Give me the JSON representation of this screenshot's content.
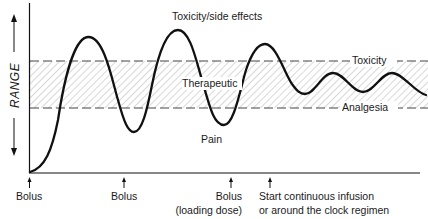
{
  "diagram": {
    "y_axis_label": "RANGE",
    "zones": {
      "upper": "Toxicity/side effects",
      "middle": "Therapeutic",
      "lower": "Pain"
    },
    "thresholds": {
      "upper": "Toxicity",
      "lower": "Analgesia"
    },
    "events": [
      {
        "label": "Bolus",
        "sublabel": ""
      },
      {
        "label": "Bolus",
        "sublabel": ""
      },
      {
        "label": "Bolus",
        "sublabel": "(loading dose)"
      },
      {
        "label": "Start continuous infusion",
        "sublabel": "or around the clock regimen"
      }
    ],
    "colors": {
      "line": "#111111",
      "hatch": "#9a9a9a",
      "dash": "#444444",
      "background": "#ffffff"
    }
  }
}
